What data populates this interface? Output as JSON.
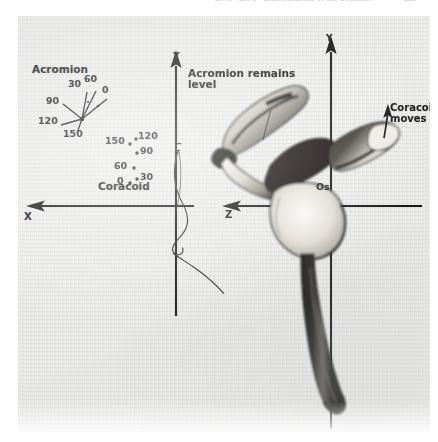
{
  "header": {
    "running_text": "CHAPTER 8 • Biomechanics of the Shoulder",
    "page_number": "225"
  },
  "figure": {
    "left_panel": {
      "group_label_acromion": "Acromion",
      "group_label_coracoid": "Coracoid",
      "axis_y_label": "Y",
      "axis_x_label": "X",
      "acromion_fan": {
        "description": "radiating lines from a common origin, each tipped with an elevation-angle value in degrees",
        "origin": {
          "x": 64,
          "y": 103
        },
        "rays": [
          {
            "label": "0",
            "angle_deg": 0,
            "tip": {
              "x": 88,
              "y": 84
            },
            "label_pos": {
              "x": 84,
              "y": 72
            }
          },
          {
            "label": "30",
            "angle_deg": 30,
            "tip": {
              "x": 70,
              "y": 78
            },
            "label_pos": {
              "x": 52,
              "y": 66
            }
          },
          {
            "label": "60",
            "angle_deg": 60,
            "tip": {
              "x": 77,
              "y": 76
            },
            "label_pos": {
              "x": 66,
              "y": 62
            }
          },
          {
            "label": "90",
            "angle_deg": 90,
            "tip": {
              "x": 45,
              "y": 89
            },
            "label_pos": {
              "x": 30,
              "y": 82
            }
          },
          {
            "label": "120",
            "angle_deg": 120,
            "tip": {
              "x": 44,
              "y": 109
            },
            "label_pos": {
              "x": 24,
              "y": 103
            }
          },
          {
            "label": "150",
            "angle_deg": 150,
            "tip": {
              "x": 58,
              "y": 118
            },
            "label_pos": {
              "x": 50,
              "y": 115
            }
          }
        ]
      },
      "coracoid_dots": {
        "description": "scattered plotted points showing displacement of the coracoid at successive elevation angles",
        "points": [
          {
            "label": "150",
            "dot": {
              "x": 112,
              "y": 128
            },
            "label_pos": {
              "x": 90,
              "y": 122
            }
          },
          {
            "label": "120",
            "dot": {
              "x": 118,
              "y": 124
            },
            "label_pos": {
              "x": 121,
              "y": 118
            }
          },
          {
            "label": "90",
            "dot": {
              "x": 119,
              "y": 137
            },
            "label_pos": {
              "x": 122,
              "y": 132
            }
          },
          {
            "label": "60",
            "dot": {
              "x": 116,
              "y": 152
            },
            "label_pos": {
              "x": 99,
              "y": 147
            }
          },
          {
            "label": "30",
            "dot": {
              "x": 118,
              "y": 163
            },
            "label_pos": {
              "x": 121,
              "y": 158
            }
          },
          {
            "label": "0",
            "dot": {
              "x": 112,
              "y": 166
            },
            "label_pos": {
              "x": 100,
              "y": 161
            }
          }
        ]
      }
    },
    "right_panel": {
      "axis_y_label": "Y",
      "axis_z_label": "Z",
      "callout_acromion": "Acromion remains\nlevel",
      "callout_coracoid": "Coracoid\nmoves up",
      "bone_landmark": "Os"
    }
  },
  "colors": {
    "ink": "#1b1b1b",
    "plate_paper": "#ececea",
    "page_white": "#ffffff",
    "header_gray": "#d3d3d6",
    "bone_dark": "#161616",
    "bone_light": "#f4f2ee"
  }
}
